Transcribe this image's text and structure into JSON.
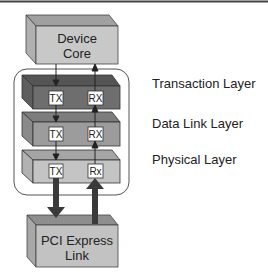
{
  "diagram": {
    "top_box": {
      "line1": "Device",
      "line2": "Core"
    },
    "bottom_box": {
      "line1": "PCI Express",
      "line2": "Link"
    },
    "layers": [
      {
        "name": "Transaction Layer",
        "tx": "TX",
        "rx": "RX",
        "front_color": "#6e6e6e",
        "top_color": "#555555",
        "side_color": "#5e5e5e"
      },
      {
        "name": "Data Link Layer",
        "tx": "TX",
        "rx": "RX",
        "front_color": "#9c9c9c",
        "top_color": "#7d7d7d",
        "side_color": "#8a8a8a"
      },
      {
        "name": "Physical Layer",
        "tx": "TX",
        "rx": "Rx",
        "front_color": "#c4c4c4",
        "top_color": "#a5a5a5",
        "side_color": "#b2b2b2"
      }
    ],
    "colors": {
      "device_core_front": "#c8c8c8",
      "device_core_top": "#a0a0a0",
      "device_core_side": "#b0b0b0",
      "pci_front": "#c2c2c2",
      "pci_top": "#8e8e8e",
      "pci_side": "#a8a8a8",
      "arrow": "#333333",
      "container_stroke": "#555555"
    }
  }
}
